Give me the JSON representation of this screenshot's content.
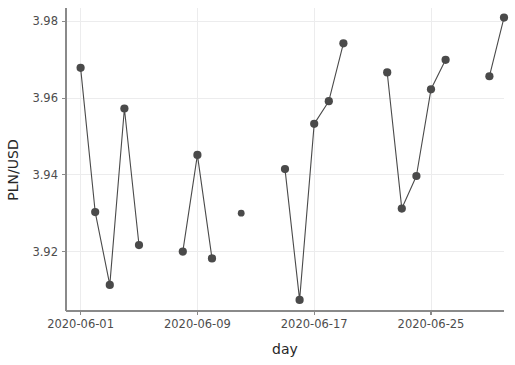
{
  "chart_data": {
    "type": "line",
    "title": "",
    "subtitle": "",
    "xlabel": "day",
    "ylabel": "PLN/USD",
    "grid": true,
    "legend": false,
    "marker": "circle",
    "line_color": "#4a4a4a",
    "marker_color": "#4a4a4a",
    "grid_color": "#ececed",
    "background_color": "#ffffff",
    "x_type": "date",
    "xlim": [
      "2020-05-31",
      "2020-06-30"
    ],
    "ylim": [
      3.9045,
      3.9835
    ],
    "ytick_labels": [
      "3.98",
      "3.96",
      "3.94",
      "3.92"
    ],
    "ytick_values": [
      3.98,
      3.96,
      3.94,
      3.92
    ],
    "xtick_labels": [
      "2020-06-01",
      "2020-06-09",
      "2020-06-17",
      "2020-06-25"
    ],
    "xtick_values": [
      "2020-06-01",
      "2020-06-09",
      "2020-06-17",
      "2020-06-25"
    ],
    "x": [
      "2020-06-01",
      "2020-06-02",
      "2020-06-03",
      "2020-06-04",
      "2020-06-05",
      "2020-06-08",
      "2020-06-09",
      "2020-06-10",
      "2020-06-12",
      "2020-06-15",
      "2020-06-16",
      "2020-06-17",
      "2020-06-18",
      "2020-06-19",
      "2020-06-22",
      "2020-06-23",
      "2020-06-24",
      "2020-06-25",
      "2020-06-26",
      "2020-06-29",
      "2020-06-30"
    ],
    "values": [
      3.9679,
      3.9303,
      3.9113,
      3.9573,
      3.9217,
      3.92,
      3.9452,
      3.9182,
      3.93,
      3.9415,
      3.9074,
      3.9533,
      3.9592,
      3.9743,
      3.9667,
      3.9312,
      3.9397,
      3.9623,
      3.97,
      3.9657,
      3.981
    ],
    "segments": [
      {
        "x": [
          "2020-06-01",
          "2020-06-02",
          "2020-06-03",
          "2020-06-04",
          "2020-06-05"
        ],
        "values": [
          3.9679,
          3.9303,
          3.9113,
          3.9573,
          3.9217
        ]
      },
      {
        "x": [
          "2020-06-08",
          "2020-06-09",
          "2020-06-10"
        ],
        "values": [
          3.92,
          3.9452,
          3.9182
        ]
      },
      {
        "x": [
          "2020-06-12"
        ],
        "values": [
          3.93
        ]
      },
      {
        "x": [
          "2020-06-15",
          "2020-06-16",
          "2020-06-17",
          "2020-06-18",
          "2020-06-19"
        ],
        "values": [
          3.9415,
          3.9074,
          3.9533,
          3.9592,
          3.9743
        ]
      },
      {
        "x": [
          "2020-06-22",
          "2020-06-23",
          "2020-06-24",
          "2020-06-25",
          "2020-06-26"
        ],
        "values": [
          3.9667,
          3.9312,
          3.9397,
          3.9623,
          3.97
        ]
      },
      {
        "x": [
          "2020-06-29",
          "2020-06-30"
        ],
        "values": [
          3.9657,
          3.981
        ]
      }
    ]
  }
}
